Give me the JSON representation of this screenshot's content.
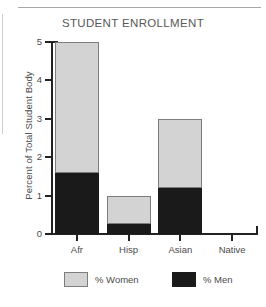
{
  "chart_data": {
    "type": "bar",
    "stacked": true,
    "title": "STUDENT ENROLLMENT",
    "xlabel": "",
    "ylabel": "Percent of Total Student Body",
    "categories": [
      "Afr",
      "Hisp",
      "Asian",
      "Native"
    ],
    "ylim": [
      0,
      5
    ],
    "yticks": [
      "0",
      "1",
      "2",
      "3",
      "4",
      "5"
    ],
    "ytick_values": [
      0,
      1,
      2,
      3,
      4,
      5
    ],
    "grid": false,
    "legend_position": "bottom",
    "series": [
      {
        "name": "% Men",
        "color": "#1a1a1a",
        "values": [
          1.6,
          0.25,
          1.2,
          0
        ]
      },
      {
        "name": "% Women",
        "color": "#d3d3d3",
        "values": [
          3.4,
          0.75,
          1.8,
          0
        ]
      }
    ],
    "totals": [
      5.0,
      1.0,
      3.0,
      0
    ],
    "legend": [
      {
        "label": "% Women",
        "color": "#d3d3d3"
      },
      {
        "label": "% Men",
        "color": "#1a1a1a"
      }
    ],
    "axis_color": "#222222",
    "text_color": "#4a4a4a"
  }
}
